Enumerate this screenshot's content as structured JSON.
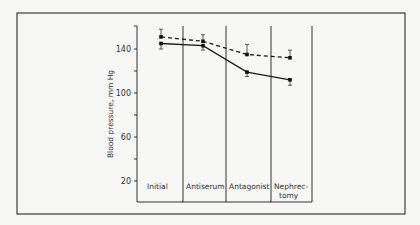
{
  "chart_data": {
    "type": "line",
    "title": "",
    "xlabel": "",
    "ylabel": "Blood pressure, mm Hg",
    "ylim": [
      0,
      160
    ],
    "yticks": [
      20,
      60,
      100,
      140
    ],
    "yticks_minor": [
      40,
      80,
      120
    ],
    "grid": false,
    "categories": [
      "Initial",
      "Antiserum",
      "Antagonist",
      "Nephrec-\ntomy"
    ],
    "category_lines": [
      [
        "Initial"
      ],
      [
        "Antiserum"
      ],
      [
        "Antagonist"
      ],
      [
        "Nephrec-",
        "tomy"
      ]
    ],
    "series": [
      {
        "name": "dashed",
        "style": "dashed",
        "values": [
          151,
          147,
          135,
          132
        ],
        "err": [
          7,
          6,
          9,
          7
        ]
      },
      {
        "name": "solid",
        "style": "solid",
        "values": [
          145,
          143,
          119,
          112
        ],
        "err": [
          5,
          4,
          4,
          5
        ]
      }
    ],
    "legend": "none"
  }
}
